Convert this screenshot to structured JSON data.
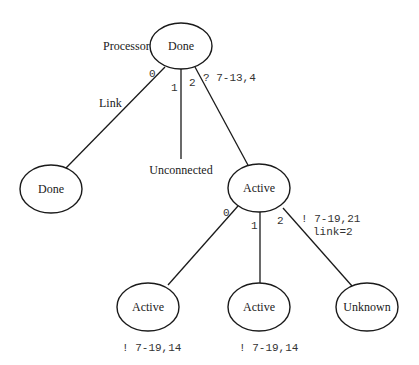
{
  "diagram": {
    "root": {
      "label": "Done",
      "side_label": "Processor",
      "annotation": "? 7-13,4"
    },
    "root_edges": [
      {
        "index": "0",
        "label": "Link"
      },
      {
        "index": "1"
      },
      {
        "index": "2"
      }
    ],
    "level1": [
      {
        "label": "Done"
      },
      {
        "label": "Unconnected",
        "is_text_only": true
      },
      {
        "label": "Active",
        "annotation_line1": "! 7-19,21",
        "annotation_line2": "link=2"
      }
    ],
    "active_edges": [
      {
        "index": "0"
      },
      {
        "index": "1"
      },
      {
        "index": "2"
      }
    ],
    "level2": [
      {
        "label": "Active",
        "annotation": "! 7-19,14"
      },
      {
        "label": "Active",
        "annotation": "! 7-19,14"
      },
      {
        "label": "Unknown"
      }
    ]
  }
}
